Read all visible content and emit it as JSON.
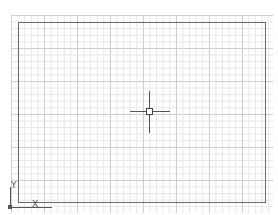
{
  "canvas": {
    "background": "#ffffff",
    "grid": {
      "minor_color": "#e6e6e6",
      "major_color": "#cfcfcf"
    },
    "limits_border_color": "#6b6b6b"
  },
  "cursor": {
    "type": "crosshair-with-pickbox"
  },
  "ucs_icon": {
    "x_label": "X",
    "y_label": "Y"
  }
}
